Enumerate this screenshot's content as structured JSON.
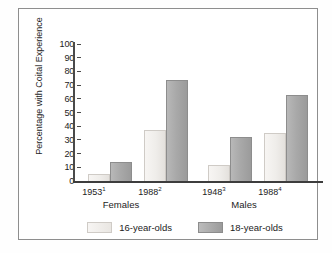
{
  "chart_data": {
    "type": "bar",
    "title": "",
    "xlabel": "",
    "ylabel": "Percentage with Coital Experience",
    "ylim": [
      0,
      100
    ],
    "ytick_step": 10,
    "yticks": [
      "100",
      "90",
      "80",
      "70",
      "60",
      "50",
      "40",
      "30",
      "20",
      "10",
      "0"
    ],
    "grid": false,
    "legend_position": "bottom",
    "categories": [
      "1953¹",
      "1988²",
      "1948³",
      "1988⁴"
    ],
    "category_plain": [
      "1953",
      "1988",
      "1948",
      "1988"
    ],
    "category_footnotes": [
      "1",
      "2",
      "3",
      "4"
    ],
    "groups": [
      {
        "label": "Females",
        "categories": [
          "1953¹",
          "1988²"
        ]
      },
      {
        "label": "Males",
        "categories": [
          "1948³",
          "1988⁴"
        ]
      }
    ],
    "series": [
      {
        "name": "16-year-olds",
        "color": "#efedea",
        "values": [
          5,
          37,
          12,
          35
        ]
      },
      {
        "name": "18-year-olds",
        "color": "#a9a9a9",
        "values": [
          14,
          74,
          32,
          63
        ]
      }
    ]
  },
  "axis": {
    "y_title": "Percentage with Coital Experience",
    "ticks": [
      {
        "value": 100,
        "label": "100"
      },
      {
        "value": 90,
        "label": "90"
      },
      {
        "value": 80,
        "label": "80"
      },
      {
        "value": 70,
        "label": "70"
      },
      {
        "value": 60,
        "label": "60"
      },
      {
        "value": 50,
        "label": "50"
      },
      {
        "value": 40,
        "label": "40"
      },
      {
        "value": 30,
        "label": "30"
      },
      {
        "value": 20,
        "label": "20"
      },
      {
        "value": 10,
        "label": "10"
      },
      {
        "value": 0,
        "label": "0"
      }
    ]
  },
  "x_labels": [
    {
      "year": "1953",
      "footnote": "1"
    },
    {
      "year": "1988",
      "footnote": "2"
    },
    {
      "year": "1948",
      "footnote": "3"
    },
    {
      "year": "1988",
      "footnote": "4"
    }
  ],
  "group_labels": [
    {
      "label": "Females"
    },
    {
      "label": "Males"
    }
  ],
  "legend": {
    "items": [
      {
        "label": "16-year-olds",
        "color": "#efedea"
      },
      {
        "label": "18-year-olds",
        "color": "#a9a9a9"
      }
    ]
  }
}
